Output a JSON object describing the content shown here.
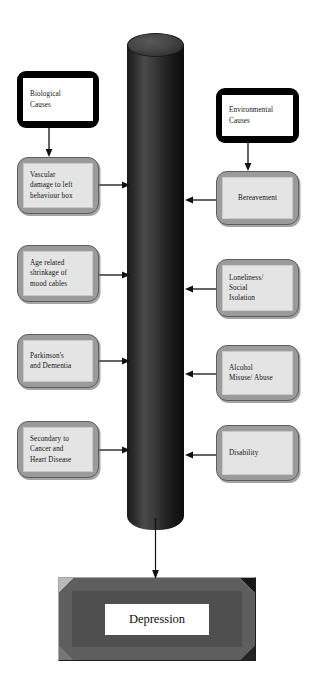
{
  "diagram": {
    "type": "flowchart",
    "background_color": "#ffffff",
    "central_element": {
      "name": "central-cylinder",
      "shape": "cylinder",
      "color": "#2b2b2b",
      "label": ""
    },
    "outcome": {
      "label": "Depression",
      "shape": "beveled-rectangle",
      "fill_color": "#5a5a5a",
      "plate_color": "#ffffff"
    },
    "left_column": {
      "heading_node": {
        "id": "biological-causes",
        "style": "root",
        "lines": [
          "Biological",
          "Causes"
        ]
      },
      "nodes": [
        {
          "id": "vascular-damage",
          "style": "grey",
          "lines": [
            "Vascular",
            "damage to left",
            "behaviour box"
          ]
        },
        {
          "id": "age-related-shrinkage",
          "style": "grey",
          "lines": [
            "Age related",
            "shrinkage of",
            "mood cables"
          ]
        },
        {
          "id": "parkinsons-dementia",
          "style": "grey",
          "lines": [
            "Parkinson's",
            "and Dementia"
          ]
        },
        {
          "id": "secondary-cancer-heart",
          "style": "grey",
          "lines": [
            "Secondary to",
            "Cancer and",
            "Heart Disease"
          ]
        }
      ]
    },
    "right_column": {
      "heading_node": {
        "id": "environmental-causes",
        "style": "root",
        "lines": [
          "Environmental",
          "Causes"
        ]
      },
      "nodes": [
        {
          "id": "bereavement",
          "style": "grey",
          "lines": [
            "Bereavement"
          ]
        },
        {
          "id": "loneliness-social-isolation",
          "style": "grey",
          "lines": [
            "Loneliness/",
            "Social",
            "Isolation"
          ]
        },
        {
          "id": "alcohol-misuse",
          "style": "grey",
          "lines": [
            "Alcohol",
            "Misuse/ Abuse"
          ]
        },
        {
          "id": "disability",
          "style": "grey",
          "lines": [
            "Disability"
          ]
        }
      ]
    },
    "connectors": {
      "left_to_cylinder_direction": "right",
      "right_to_cylinder_direction": "left",
      "root_to_child_direction": "down",
      "cylinder_to_outcome_direction": "down",
      "color": "#111111"
    },
    "colors": {
      "root_box_border": "#000000",
      "root_box_fill": "#ffffff",
      "grey_box_border": "#9b9b9b",
      "grey_box_fill": "#e4e4e4",
      "cylinder": "#2b2b2b",
      "outcome_frame": "#5a5a5a"
    }
  }
}
